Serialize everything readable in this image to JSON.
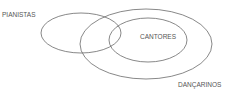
{
  "diagram": {
    "type": "venn",
    "stroke_color": "#6a6a6a",
    "sets": [
      {
        "name": "PIANISTAS",
        "label": "PIANISTAS"
      },
      {
        "name": "DANÇARINOS",
        "label": "DANÇARINOS"
      },
      {
        "name": "CANTORES",
        "label": "CANTORES"
      }
    ]
  }
}
